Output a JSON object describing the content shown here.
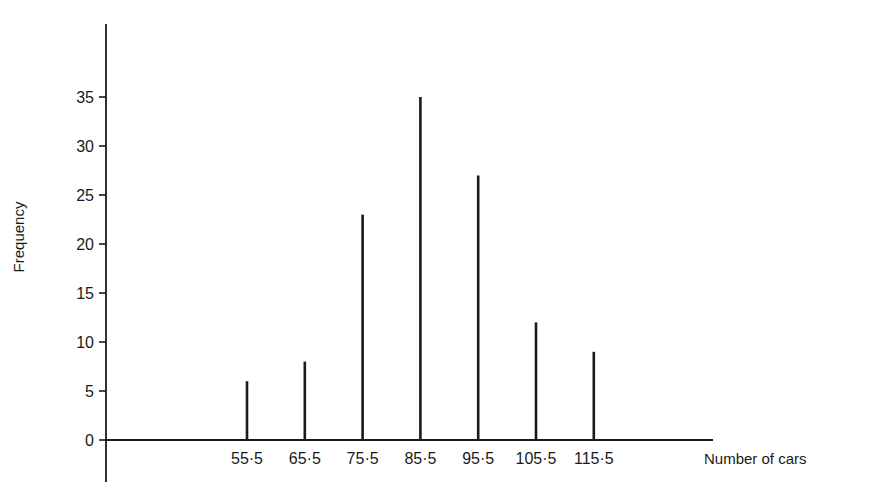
{
  "chart_data": {
    "type": "bar",
    "style": "vertical line diagram (stick bars)",
    "title": "",
    "xlabel": "Number of cars",
    "ylabel": "Frequency",
    "categories": [
      "55·5",
      "65·5",
      "75·5",
      "85·5",
      "95·5",
      "105·5",
      "115·5"
    ],
    "x": [
      55.5,
      65.5,
      75.5,
      85.5,
      95.5,
      105.5,
      115.5
    ],
    "values": [
      6,
      8,
      23,
      35,
      27,
      12,
      9
    ],
    "ylim": [
      0,
      40
    ],
    "yticks": [
      0,
      5,
      10,
      15,
      20,
      25,
      30,
      35
    ],
    "ytick_labels": [
      "0",
      "5",
      "10",
      "15",
      "20",
      "25",
      "30",
      "35"
    ],
    "grid": false,
    "legend": null,
    "colors": {
      "line": "#1a1a1a",
      "background": "#ffffff"
    }
  }
}
